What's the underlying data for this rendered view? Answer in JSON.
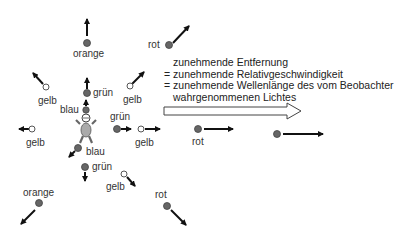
{
  "caption": {
    "line1": "zunehmende Entfernung",
    "line2": "= zunehmende Relativgeschwindigkeit",
    "line3": "= zunehmende Wellenlänge des vom Beobachter",
    "line4": "wahrgenommenen Lichtes"
  },
  "labels": {
    "orange_top": "orange",
    "rot_top": "rot",
    "gelb_upper_left": "gelb",
    "gruen_upper": "grün",
    "gelb_upper_right": "gelb",
    "blau_upper": "blau",
    "gruen_right_near": "grün",
    "gelb_left": "gelb",
    "gelb_right": "gelb",
    "rot_right": "rot",
    "blau_lower": "blau",
    "gruen_lower": "grün",
    "gelb_lower_right": "gelb",
    "orange_lower_left": "orange",
    "rot_lower_right": "rot"
  },
  "colors": {
    "dot_filled": "#666666",
    "dot_hollow_fill": "#ffffff",
    "arrow": "#111111",
    "observer_body": "#aaaaaa"
  }
}
